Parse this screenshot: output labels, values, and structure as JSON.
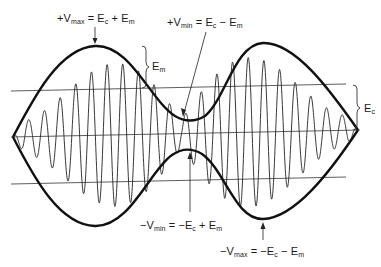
{
  "labels": {
    "vmax_pos": {
      "prefix": "+V",
      "sub": "max",
      "eq": " = E",
      "sub2": "c",
      "mid": " + E",
      "sub3": "m"
    },
    "vmin_pos": {
      "prefix": "+V",
      "sub": "min",
      "eq": " = E",
      "sub2": "c",
      "mid": " − E",
      "sub3": "m"
    },
    "vmin_neg": {
      "prefix": "−V",
      "sub": "min",
      "eq": " = −E",
      "sub2": "c",
      "mid": " + E",
      "sub3": "m"
    },
    "vmax_neg": {
      "prefix": "−V",
      "sub": "max",
      "eq": " = −E",
      "sub2": "c",
      "mid": " − E",
      "sub3": "m"
    },
    "em": {
      "prefix": "E",
      "sub": "m"
    },
    "ec": {
      "prefix": "E",
      "sub": "c"
    }
  },
  "colors": {
    "line": "#111111",
    "background": "#ffffff"
  }
}
